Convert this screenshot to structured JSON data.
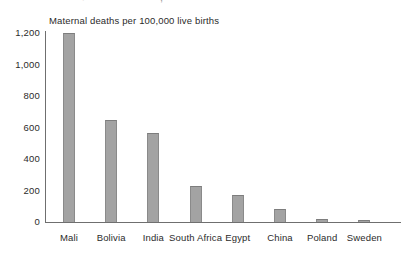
{
  "figure": {
    "title": "Maternal deaths per 100,000 live births",
    "cropped_top_text": {
      "bullet": "●",
      "middle": ",",
      "right": "·"
    }
  },
  "colors": {
    "bar_fill": "#a3a3a3",
    "bar_edge": "#8a8a8a",
    "axis": "#6f6f6f",
    "text": "#2b2b2b",
    "background": "#ffffff"
  },
  "axis": {
    "y_tick_labels": [
      "1,200",
      "1,000",
      "800",
      "600",
      "400",
      "200",
      "0"
    ],
    "x_tick_labels": [
      "Mali",
      "Bolivia",
      "India",
      "South Africa",
      "Egypt",
      "China",
      "Poland",
      "Sweden"
    ]
  },
  "chart_data": {
    "type": "bar",
    "title": "Maternal deaths per 100,000 live births",
    "subtitle": "",
    "xlabel": "",
    "ylabel": "",
    "categories": [
      "Mali",
      "Bolivia",
      "India",
      "South Africa",
      "Egypt",
      "China",
      "Poland",
      "Sweden"
    ],
    "values": [
      1200,
      650,
      565,
      230,
      170,
      85,
      20,
      8
    ],
    "ylim": [
      0,
      1200
    ],
    "yticks": [
      0,
      200,
      400,
      600,
      800,
      1000,
      1200
    ],
    "ytick_labels": [
      "0",
      "200",
      "400",
      "600",
      "800",
      "1,000",
      "1,200"
    ],
    "grid": false,
    "legend": null,
    "legend_position": "none",
    "annotations": []
  }
}
